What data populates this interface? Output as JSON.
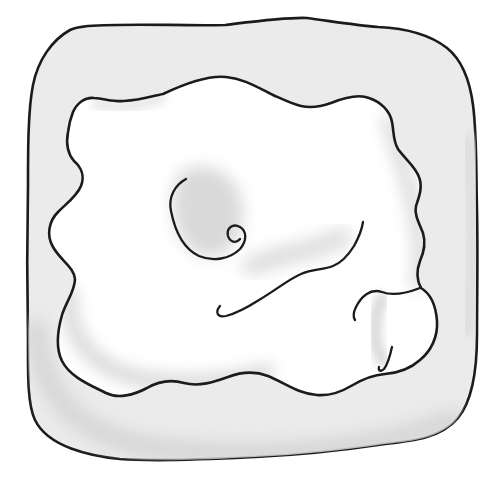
{
  "palette": {
    "background": "#ffffff",
    "slab_fill": "#ebebeb",
    "outline_ink": "#1b1b1b",
    "shading_mid": "#d7d7d7",
    "shading_soft": "#dedede",
    "shading_faint": "#e3e3e3"
  },
  "drawing": {
    "width": "501",
    "height": "485",
    "paths": {
      "outer": "M 88,26 C 130,23 180,26 225,25 C 258,21 288,17 307,18 C 330,21 355,25 378,27 C 400,28 428,33 447,48 C 462,60 470,82 473,105 C 477,135 476,170 477,210 C 478,255 477,300 477,335 C 477,370 473,400 458,418 C 441,438 414,441 385,444 C 345,450 300,455 255,457 C 215,459 160,462 120,459 C 90,456 48,447 35,420 C 27,403 28,370 28,340 C 27,290 27,235 28,185 C 28,150 28,110 33,85 C 38,60 52,40 70,30 C 76,27 82,27 88,26 Z",
      "ring_shadow_bottom": "M 36,330 C 42,400 80,440 170,450 C 270,460 380,450 452,420",
      "ring_shadow_right": "M 468,140 C 474,200 475,270 468,330",
      "blob": "M 73,112 C 77,103 85,97 94,98 C 106,99 114,102 124,101 C 142,100 152,96 163,94 C 182,85 207,75 226,77 C 246,79 260,89 273,95 C 282,99 292,104 301,106 C 310,108 320,107 331,103 C 346,97 359,94 369,98 C 381,102 390,111 392,122 C 394,132 393,141 398,149 C 405,159 415,166 419,177 C 423,187 419,197 416,206 C 414,214 419,223 423,233 C 426,243 424,252 420,261 C 417,269 416,279 421,288 C 431,294 436,307 437,321 C 438,337 431,351 420,360 C 410,369 397,373 385,374 C 371,375 361,380 351,386 C 341,392 329,396 317,395 C 299,394 285,383 268,376 C 255,371 241,372 228,377 C 214,382 199,387 184,383 C 170,379 159,381 147,388 C 134,395 118,399 106,393 C 90,385 70,377 62,361 C 55,347 58,329 62,315 C 66,302 75,291 75,279 C 74,267 61,261 53,247 C 46,235 49,221 58,212 C 67,203 77,196 81,186 C 85,176 81,167 74,161 C 68,154 66,143 68,132 C 69,124 71,117 73,112 Z",
      "shade_spiral": "M 182,172 C 200,160 228,168 238,190 C 248,212 243,243 222,254 C 202,263 184,250 177,229 C 171,211 170,183 182,172 Z",
      "shade_band": "M 252,266 C 282,254 316,250 342,238",
      "shade_bottom_left": "M 70,295 C 66,335 92,372 150,380 C 200,387 240,378 268,372",
      "shade_top_right": "M 388,122 C 400,155 414,195 419,240 C 421,260 420,272 417,283",
      "shade_lobe": "M 382,298 C 373,318 372,342 383,361",
      "shade_top_left": "M 96,104 C 122,109 146,104 162,98",
      "spiral": "M 186,179 C 175,185 168,197 171,211 C 175,231 184,249 199,256 C 213,262 230,259 240,249 C 247,241 247,231 240,227 C 233,223 226,228 228,236 C 230,242 236,244 240,239",
      "long_curve": "M 220,306 C 215,312 217,318 226,316 C 238,313 248,307 259,300 C 276,290 289,279 301,274 C 313,269 323,270 333,266 C 343,262 349,254 354,246 C 359,237 362,229 363,222",
      "lobe_crease": "M 420,288 C 407,293 392,296 382,292 C 370,288 361,297 356,307 C 353,313 353,317 355,320",
      "lobe_hook": "M 392,347 C 390,356 388,364 384,369 C 381,372 378,371 379,367"
    }
  }
}
